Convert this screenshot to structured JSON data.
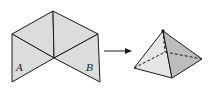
{
  "diagram": {
    "net": {
      "labels": {
        "a": "A",
        "b": "B"
      },
      "fill": "#dcdcdc",
      "stroke": "#1a1a1a"
    },
    "arrow": {
      "direction": "right"
    },
    "pyramid": {
      "faces": {
        "front": "#e6e6e6",
        "right": "#bdbdbd",
        "left": "#d4d4d4"
      },
      "hidden_edges": "dashed"
    }
  }
}
